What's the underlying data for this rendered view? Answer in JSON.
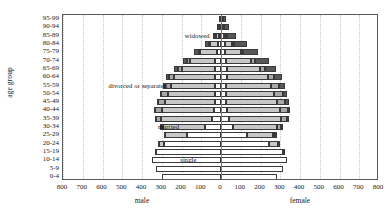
{
  "chart_data": {
    "type": "bar",
    "subtype": "population-pyramid",
    "title": "",
    "xlabel": "",
    "ylabel": "age group",
    "xlim": [
      -800,
      800
    ],
    "x_tick_values": [
      -800,
      -700,
      -600,
      -500,
      -400,
      -300,
      -200,
      -100,
      0,
      100,
      200,
      300,
      400,
      500,
      600,
      700,
      800
    ],
    "x_tick_labels": [
      "800",
      "700",
      "600",
      "500",
      "400",
      "300",
      "200",
      "100",
      "0",
      "100",
      "200",
      "300",
      "400",
      "500",
      "600",
      "700",
      "800"
    ],
    "grid": true,
    "grid_axis": "x",
    "side_labels": {
      "left": "male",
      "right": "female"
    },
    "categories": [
      "95-99",
      "90-94",
      "85-89",
      "80-84",
      "75-79",
      "70-74",
      "65-69",
      "60-64",
      "55-59",
      "50-54",
      "45-49",
      "40-44",
      "35-39",
      "30-34",
      "25-29",
      "20-24",
      "15-19",
      "10-14",
      "5-9",
      "0-4"
    ],
    "stack_order": [
      "single",
      "married",
      "divorced or separated",
      "widowed"
    ],
    "stack_colors": {
      "single": "#ffffff",
      "married": "#c7c7c7",
      "divorced or separated": "#a8a8a8",
      "widowed": "#585858"
    },
    "annotations": [
      {
        "text": "widowed",
        "x": -120,
        "age_group": "85-89"
      },
      {
        "text": "divorced or separated",
        "x": -420,
        "age_group": "55-59"
      },
      {
        "text": "married",
        "x": -265,
        "age_group": "30-34"
      },
      {
        "text": "single",
        "x": -165,
        "age_group": "10-14"
      }
    ],
    "series": [
      {
        "name": "male",
        "side": "left",
        "stacks": {
          "single": [
            4,
            6,
            10,
            16,
            22,
            28,
            30,
            32,
            30,
            28,
            30,
            34,
            44,
            80,
            170,
            290,
            330,
            348,
            330,
            300
          ],
          "married": [
            3,
            6,
            16,
            42,
            82,
            128,
            168,
            206,
            224,
            240,
            252,
            266,
            262,
            212,
            112,
            28,
            2,
            0,
            0,
            0
          ],
          "divorced or separated": [
            0,
            1,
            2,
            5,
            9,
            14,
            20,
            26,
            30,
            34,
            36,
            34,
            28,
            18,
            8,
            2,
            0,
            0,
            0,
            0
          ],
          "widowed": [
            4,
            7,
            12,
            18,
            22,
            22,
            18,
            14,
            10,
            8,
            6,
            4,
            2,
            1,
            0,
            0,
            0,
            0,
            0,
            0
          ]
        },
        "totals": [
          11,
          20,
          40,
          81,
          135,
          192,
          236,
          278,
          294,
          310,
          324,
          338,
          336,
          311,
          290,
          320,
          332,
          348,
          330,
          300
        ]
      },
      {
        "name": "female",
        "side": "right",
        "stacks": {
          "single": [
            6,
            9,
            13,
            18,
            22,
            26,
            28,
            28,
            26,
            26,
            26,
            30,
            38,
            62,
            130,
            244,
            312,
            332,
            314,
            286
          ],
          "married": [
            2,
            5,
            14,
            38,
            78,
            126,
            170,
            208,
            228,
            244,
            256,
            268,
            264,
            222,
            134,
            46,
            4,
            0,
            0,
            0
          ],
          "divorced or separated": [
            1,
            2,
            4,
            8,
            13,
            19,
            26,
            32,
            38,
            42,
            44,
            40,
            32,
            20,
            10,
            3,
            0,
            0,
            0,
            0
          ],
          "widowed": [
            14,
            26,
            46,
            66,
            74,
            70,
            56,
            42,
            30,
            22,
            16,
            10,
            6,
            3,
            1,
            0,
            0,
            0,
            0,
            0
          ]
        },
        "totals": [
          23,
          42,
          77,
          130,
          187,
          241,
          280,
          310,
          322,
          334,
          342,
          348,
          340,
          307,
          275,
          293,
          316,
          332,
          314,
          286
        ]
      }
    ]
  }
}
